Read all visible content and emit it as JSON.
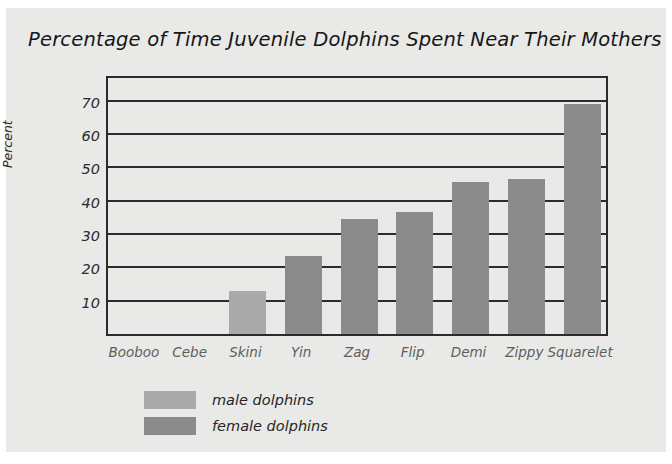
{
  "chart_data": {
    "type": "bar",
    "title": "Percentage of Time Juvenile Dolphins Spent Near Their Mothers",
    "xlabel": "",
    "ylabel": "Percent",
    "categories": [
      "Booboo",
      "Cebe",
      "Skini",
      "Yin",
      "Zag",
      "Flip",
      "Demi",
      "Zippy",
      "Squarelet"
    ],
    "values": [
      0,
      0,
      13,
      23.5,
      34.5,
      36.5,
      45.5,
      46.5,
      69
    ],
    "point_groups": [
      "male dolphins",
      "male dolphins",
      "male dolphins",
      "female dolphins",
      "female dolphins",
      "female dolphins",
      "female dolphins",
      "female dolphins",
      "female dolphins"
    ],
    "ylim": [
      0,
      78
    ],
    "yticks": [
      10,
      20,
      30,
      40,
      50,
      60,
      70
    ],
    "ytick_labels": [
      "10",
      "20",
      "30",
      "40",
      "50",
      "60",
      "70"
    ],
    "grid": true,
    "grid_axis": "y",
    "legend": {
      "position": "below-plot-left",
      "entries": [
        {
          "label": "male dolphins",
          "color": "#a9a9a9"
        },
        {
          "label": "female dolphins",
          "color": "#8b8b8b"
        }
      ]
    },
    "colors": {
      "male": "#a9a9a9",
      "female": "#8b8b8b",
      "panel_background": "#e9e9e7",
      "axis": "#2b2b2b",
      "title_text": "#161616",
      "xtick_text": "#5e5e5e"
    }
  }
}
